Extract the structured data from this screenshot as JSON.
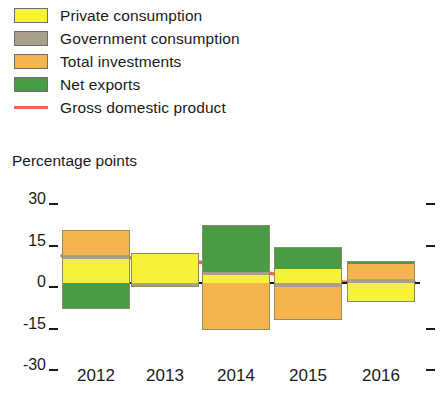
{
  "legend": {
    "items": [
      {
        "label": "Private consumption",
        "color": "#F7F13A",
        "kind": "swatch",
        "icon": "legend-swatch-icon"
      },
      {
        "label": "Government consumption",
        "color": "#A8A08C",
        "kind": "swatch",
        "icon": "legend-swatch-icon"
      },
      {
        "label": "Total investments",
        "color": "#F5B44E",
        "kind": "swatch",
        "icon": "legend-swatch-icon"
      },
      {
        "label": "Net exports",
        "color": "#4B9B46",
        "kind": "swatch",
        "icon": "legend-swatch-icon"
      },
      {
        "label": "Gross domestic product",
        "color": "#F4644A",
        "kind": "line",
        "icon": "legend-line-icon"
      }
    ]
  },
  "axis": {
    "y_title": "Percentage points",
    "y_ticks": [
      "30",
      "15",
      "0",
      "-15",
      "-30"
    ],
    "x_ticks": [
      "2012",
      "2013",
      "2014",
      "2015",
      "2016"
    ]
  },
  "chart_data": {
    "type": "bar",
    "title": "",
    "subtitle": "",
    "xlabel": "",
    "ylabel": "Percentage points",
    "ylim": [
      -30,
      30
    ],
    "yticks": [
      30,
      15,
      0,
      -15,
      -30
    ],
    "grid": false,
    "stacked": true,
    "legend_position": "top-left",
    "categories": [
      "2012",
      "2013",
      "2014",
      "2015",
      "2016"
    ],
    "series": [
      {
        "name": "Private consumption",
        "color": "#F7F13A",
        "values": [
          8.5,
          11.0,
          3.0,
          5.0,
          -7.0
        ]
      },
      {
        "name": "Government consumption",
        "color": "#A8A08C",
        "values": [
          1.5,
          -1.5,
          1.0,
          -1.5,
          1.5
        ]
      },
      {
        "name": "Total investments",
        "color": "#F5B44E",
        "values": [
          9.0,
          0.0,
          -17.0,
          -12.0,
          5.5
        ]
      },
      {
        "name": "Net exports",
        "color": "#4B9B46",
        "values": [
          -9.5,
          0.0,
          17.0,
          8.0,
          0.8
        ]
      }
    ],
    "overlay_line": {
      "name": "Gross domestic product",
      "color": "#F4644A",
      "type": "line",
      "x": [
        "2012",
        "2013",
        "2014",
        "2015",
        "2016"
      ],
      "values": [
        9.5,
        8.5,
        6.0,
        1.0,
        0.2
      ]
    }
  }
}
